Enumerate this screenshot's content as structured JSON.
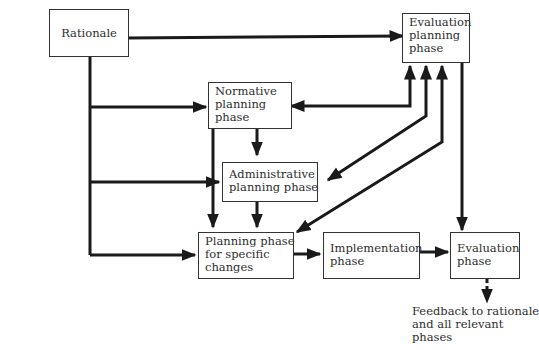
{
  "diagram": {
    "nodes": {
      "rationale": {
        "lines": [
          "Rationale"
        ]
      },
      "evaluation_planning": {
        "lines": [
          "Evaluation",
          "planning",
          "phase"
        ]
      },
      "normative_planning": {
        "lines": [
          "Normative",
          "planning",
          "phase"
        ]
      },
      "administrative_planning": {
        "lines": [
          "Administrative",
          "planning phase"
        ]
      },
      "planning_specific": {
        "lines": [
          "Planning phase",
          "for specific",
          "changes"
        ]
      },
      "implementation": {
        "lines": [
          "Implementation",
          "phase"
        ]
      },
      "evaluation": {
        "lines": [
          "Evaluation",
          "phase"
        ]
      }
    },
    "feedback_note": {
      "lines": [
        "Feedback to rationale",
        "and all relevant",
        "phases"
      ]
    },
    "edges": [
      {
        "from": "Rationale",
        "to": "Evaluation planning phase"
      },
      {
        "from": "Rationale",
        "to": "Normative planning phase"
      },
      {
        "from": "Rationale",
        "to": "Administrative planning phase"
      },
      {
        "from": "Rationale",
        "to": "Planning phase for specific changes"
      },
      {
        "from": "Normative planning phase",
        "to": "Evaluation planning phase",
        "bidirectional": true
      },
      {
        "from": "Normative planning phase",
        "to": "Administrative planning phase"
      },
      {
        "from": "Normative planning phase",
        "to": "Planning phase for specific changes"
      },
      {
        "from": "Administrative planning phase",
        "to": "Planning phase for specific changes"
      },
      {
        "from": "Administrative planning phase",
        "to": "Evaluation planning phase",
        "bidirectional": true
      },
      {
        "from": "Planning phase for specific changes",
        "to": "Evaluation planning phase",
        "bidirectional": true
      },
      {
        "from": "Planning phase for specific changes",
        "to": "Implementation phase"
      },
      {
        "from": "Implementation phase",
        "to": "Evaluation phase"
      },
      {
        "from": "Evaluation planning phase",
        "to": "Evaluation phase"
      },
      {
        "from": "Evaluation phase",
        "to": "Feedback to rationale and all relevant phases",
        "style": "dashed"
      }
    ],
    "colors": {
      "line": "#1a1a1a",
      "border": "#333333",
      "text": "#2e2e2e",
      "background": "#ffffff"
    }
  }
}
